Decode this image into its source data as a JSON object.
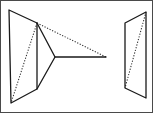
{
  "figure": {
    "canvas": {
      "width": 153,
      "height": 113,
      "background": "#ffffff"
    },
    "frame": {
      "visible": true,
      "color": "#4a4a4a",
      "width": 1
    },
    "stroke_colors": {
      "solid": "#1a1a1a",
      "dotted": "#2b2b2b",
      "frame": "#4a4a4a"
    },
    "shapes": {
      "left_plane": {
        "name": "left-quadrilateral-plane",
        "style": "solid",
        "points": "8,9 36,22 36,88 10,102"
      },
      "left_plane_diagonal": {
        "name": "left-plane-diagonal",
        "style": "dotted",
        "from": "36,22",
        "to": "10,102"
      },
      "projection_triangle": {
        "name": "projection-triangle",
        "style": "solid",
        "points": "36,22 54,56 36,88"
      },
      "axis_ray": {
        "name": "horizontal-axis-ray",
        "style": "solid",
        "from": "54,56",
        "to": "105,56"
      },
      "projection_ray": {
        "name": "upper-projection-ray",
        "style": "dotted",
        "from": "36,22",
        "to": "105,56"
      },
      "right_plane": {
        "name": "right-quadrilateral-plane",
        "style": "solid",
        "points": "124,22 145,11 145,97 124,87"
      },
      "right_plane_diagonal": {
        "name": "right-plane-diagonal",
        "style": "dotted",
        "from": "145,11",
        "to": "124,87"
      }
    }
  }
}
